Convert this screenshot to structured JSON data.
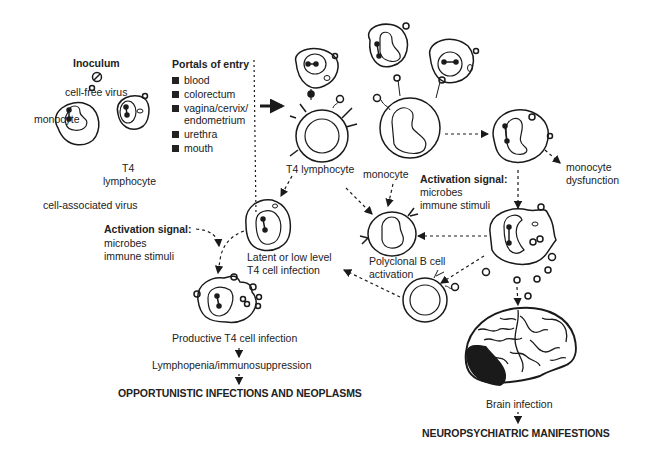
{
  "inoculum": {
    "title": "Inoculum",
    "cell_free_label": "cell-free virus",
    "monocyte_label": "monocyte",
    "t4_label_line1": "T4",
    "t4_label_line2": "lymphocyte",
    "cell_associated_label": "cell-associated virus"
  },
  "portals": {
    "title": "Portals of entry",
    "items": [
      {
        "label": "blood"
      },
      {
        "label": "colorectum"
      },
      {
        "label": "vagina/cervix/",
        "label2": "endometrium"
      },
      {
        "label": "urethra"
      },
      {
        "label": "mouth"
      }
    ]
  },
  "cells": {
    "t4_lymphocyte": "T4 lymphocyte",
    "monocyte": "monocyte",
    "monocyte_dysfunction_line1": "monocyte",
    "monocyte_dysfunction_line2": "dysfunction",
    "latent_line1": "Latent or low level",
    "latent_line2": "T4 cell infection",
    "polyclonal_line1": "Polyclonal B cell",
    "polyclonal_line2": "activation",
    "productive": "Productive T4 cell infection"
  },
  "activation_signals": [
    {
      "title": "Activation signal:",
      "line1": "microbes",
      "line2": "immune stimuli"
    },
    {
      "title": "Activation signal:",
      "line1": "microbes",
      "line2": "immune stimuli"
    }
  ],
  "outcomes": {
    "lymphopenia": "Lymphopenia/immunosuppression",
    "opportunistic": "OPPORTUNISTIC INFECTIONS AND NEOPLASMS",
    "brain_infection": "Brain infection",
    "neuropsychiatric": "NEUROPSYCHIATRIC MANIFESTIONS"
  },
  "colors": {
    "ink": "#1a1a1a",
    "background": "#ffffff"
  }
}
